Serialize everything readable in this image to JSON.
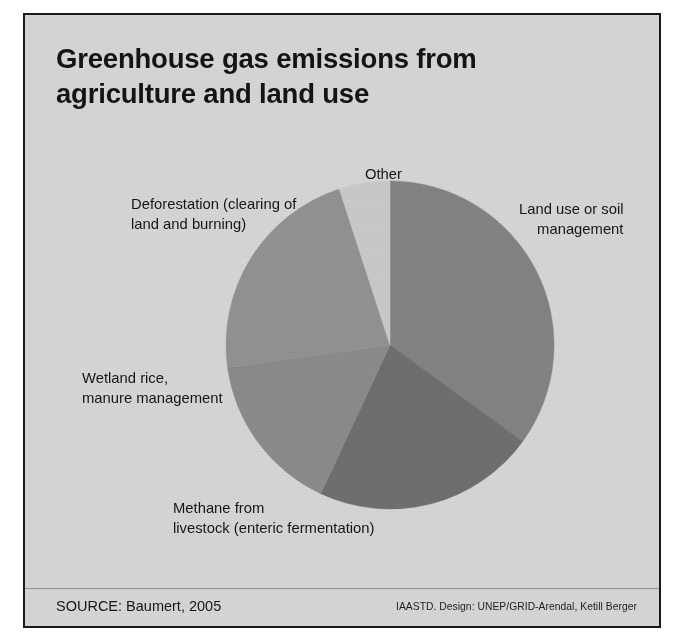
{
  "figure": {
    "title_lines": [
      "Greenhouse gas emissions from",
      "agriculture and land use"
    ],
    "source": "SOURCE: Baumert, 2005",
    "credit": "IAASTD. Design: UNEP/GRID-Arendal, Ketill Berger",
    "background_color": "#d4d4d4",
    "border_color": "#1a1a1a"
  },
  "labels": {
    "other": "Other",
    "deforestation_line1": "Deforestation (clearing of",
    "deforestation_line2": "land and burning)",
    "landuse_line1": "Land use or soil",
    "landuse_line2": "management",
    "wetland_line1": "Wetland rice,",
    "wetland_line2": "manure management",
    "methane_line1": "Methane from",
    "methane_line2": "livestock (enteric fermentation)"
  },
  "chart_data": {
    "type": "pie",
    "title": "Greenhouse gas emissions from agriculture and land use",
    "xlabel": "",
    "ylabel": "",
    "legend_position": "callout-labels",
    "grid": false,
    "categories": [
      "Land use or soil management",
      "Methane from livestock (enteric fermentation)",
      "Wetland rice, manure management",
      "Deforestation (clearing of land and burning)",
      "Other"
    ],
    "values": [
      35,
      22,
      16,
      22,
      5
    ],
    "units": "percent of total emissions",
    "slices": [
      {
        "label": "Land use or soil management",
        "value": 35,
        "color": "#828282",
        "start_angle": 0,
        "end_angle": 126
      },
      {
        "label": "Methane from livestock (enteric fermentation)",
        "value": 22,
        "color": "#6e6e6e",
        "start_angle": 126,
        "end_angle": 205
      },
      {
        "label": "Wetland rice, manure management",
        "value": 16,
        "color": "#8a8a8a",
        "start_angle": 205,
        "end_angle": 262
      },
      {
        "label": "Deforestation (clearing of land and burning)",
        "value": 22,
        "color": "#919191",
        "start_angle": 262,
        "end_angle": 342
      },
      {
        "label": "Other",
        "value": 5,
        "color": "#c8c8c8",
        "start_angle": 342,
        "end_angle": 360
      }
    ]
  }
}
